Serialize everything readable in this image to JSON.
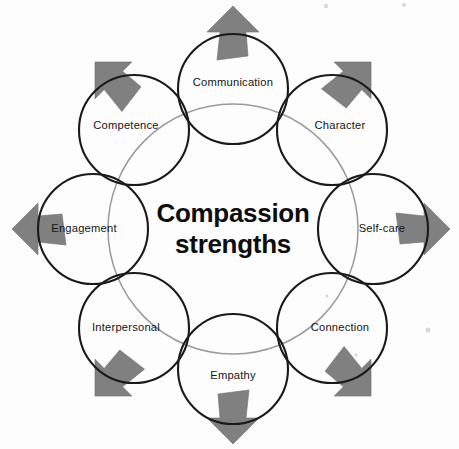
{
  "diagram": {
    "title": "Compassion strengths",
    "center_text_lines": [
      "Compassion",
      "strengths"
    ],
    "type": "radial-petal-diagram",
    "node_count": 8,
    "arrow_count": 8,
    "colors": {
      "background": "#fdfdfd",
      "circle_stroke": "#1a1a1a",
      "inner_ring_stroke": "#9a9a9a",
      "arrow_fill": "#808080",
      "arrow_stroke": "#6f6f6f",
      "label_text": "#151515",
      "center_text": "#0d0d0d"
    },
    "geometry": {
      "center_x": 233,
      "center_y": 229,
      "ring_radius": 140,
      "node_radius": 55,
      "inner_ring_radius": 125,
      "arrow_base_radius": 196
    },
    "nodes": [
      {
        "id": "communication",
        "label": "Communication",
        "angle_deg": -90,
        "cx": 233,
        "cy": 89,
        "label_dx": 0,
        "label_dy": -6
      },
      {
        "id": "character",
        "label": "Character",
        "angle_deg": -45,
        "cx": 332,
        "cy": 130,
        "label_dx": 8,
        "label_dy": -4
      },
      {
        "id": "self-care",
        "label": "Self-care",
        "angle_deg": 0,
        "cx": 373,
        "cy": 229,
        "label_dx": 9,
        "label_dy": 0
      },
      {
        "id": "connection",
        "label": "Connection",
        "angle_deg": 45,
        "cx": 332,
        "cy": 328,
        "label_dx": 8,
        "label_dy": 0
      },
      {
        "id": "empathy",
        "label": "Empathy",
        "angle_deg": 90,
        "cx": 233,
        "cy": 369,
        "label_dx": 0,
        "label_dy": 7
      },
      {
        "id": "interpersonal",
        "label": "Interpersonal",
        "angle_deg": 135,
        "cx": 134,
        "cy": 328,
        "label_dx": -8,
        "label_dy": 0
      },
      {
        "id": "engagement",
        "label": "Engagement",
        "angle_deg": 180,
        "cx": 93,
        "cy": 229,
        "label_dx": -9,
        "label_dy": 0
      },
      {
        "id": "competence",
        "label": "Competence",
        "angle_deg": -135,
        "cx": 134,
        "cy": 130,
        "label_dx": -8,
        "label_dy": -4
      }
    ],
    "arrows": [
      {
        "id": "arrow-up",
        "direction": "up",
        "angle_deg": -90,
        "tip_x": 233,
        "tip_y": 6
      },
      {
        "id": "arrow-up-right",
        "direction": "up-right",
        "angle_deg": -45,
        "tip_x": 371,
        "tip_y": 62
      },
      {
        "id": "arrow-right",
        "direction": "right",
        "angle_deg": 0,
        "tip_x": 450,
        "tip_y": 229
      },
      {
        "id": "arrow-down-right",
        "direction": "down-right",
        "angle_deg": 45,
        "tip_x": 371,
        "tip_y": 396
      },
      {
        "id": "arrow-down",
        "direction": "down",
        "angle_deg": 90,
        "tip_x": 233,
        "tip_y": 444
      },
      {
        "id": "arrow-down-left",
        "direction": "down-left",
        "angle_deg": 135,
        "tip_x": 95,
        "tip_y": 396
      },
      {
        "id": "arrow-left",
        "direction": "left",
        "angle_deg": 180,
        "tip_x": 12,
        "tip_y": 229
      },
      {
        "id": "arrow-up-left",
        "direction": "up-left",
        "angle_deg": -135,
        "tip_x": 95,
        "tip_y": 62
      }
    ]
  }
}
